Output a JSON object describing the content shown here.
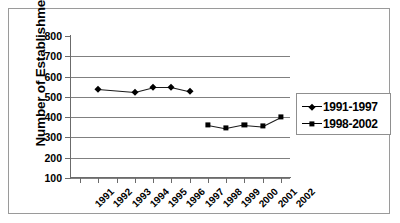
{
  "chart_data": {
    "type": "line",
    "title": "",
    "xlabel": "",
    "ylabel": "Number of Establishments",
    "ylim": [
      100,
      800
    ],
    "ytick_step": 100,
    "yticks": [
      800,
      700,
      600,
      500,
      400,
      300,
      200,
      100
    ],
    "categories": [
      "1991",
      "1992",
      "1993",
      "1994",
      "1995",
      "1996",
      "1997",
      "1998",
      "1999",
      "2000",
      "2001",
      "2002"
    ],
    "grid": true,
    "legend_position": "right",
    "series": [
      {
        "name": "1991-1997",
        "marker": "diamond",
        "x": [
          "1992",
          "1994",
          "1995",
          "1996",
          "1997"
        ],
        "values": [
          540,
          525,
          548,
          548,
          527
        ]
      },
      {
        "name": "1998-2002",
        "marker": "square",
        "x": [
          "1998",
          "1999",
          "2000",
          "2001",
          "2002"
        ],
        "values": [
          362,
          345,
          363,
          355,
          400
        ]
      }
    ]
  },
  "axis": {
    "y_title": "Number of Establishments",
    "y_labels": [
      "800",
      "700",
      "600",
      "500",
      "400",
      "300",
      "200",
      "100"
    ],
    "x_labels": [
      "1991",
      "1992",
      "1993",
      "1994",
      "1995",
      "1996",
      "1997",
      "1998",
      "1999",
      "2000",
      "2001",
      "2002"
    ]
  },
  "legend": {
    "entries": [
      {
        "label": "1991-1997",
        "marker": "diamond-marker"
      },
      {
        "label": "1998-2002",
        "marker": "square-marker"
      }
    ]
  },
  "colors": {
    "series": "#000000",
    "gridline": "#808080",
    "axis": "#6b6b6b",
    "frame": "#9a9a9a",
    "background": "#ffffff"
  }
}
